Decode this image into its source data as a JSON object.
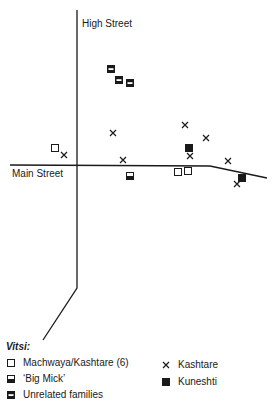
{
  "streets": {
    "high_street": {
      "label": "High Street",
      "path": [
        [
          77,
          10
        ],
        [
          77,
          288
        ],
        [
          43,
          340
        ]
      ],
      "label_pos": [
        82,
        18
      ]
    },
    "main_street": {
      "label": "Main Street",
      "path": [
        [
          10,
          165
        ],
        [
          210,
          166
        ],
        [
          267,
          178
        ]
      ],
      "label_pos": [
        12,
        168
      ]
    }
  },
  "colors": {
    "ink": "#1a1a1a",
    "paper": "#ffffff"
  },
  "markers": {
    "machwaya_kashtare": [
      [
        55,
        148
      ],
      [
        178,
        172
      ],
      [
        188,
        171
      ]
    ],
    "big_mick": [
      [
        130,
        176
      ]
    ],
    "unrelated_families": [
      [
        111,
        69
      ],
      [
        119,
        80
      ],
      [
        130,
        83
      ]
    ],
    "kashtare": [
      [
        64,
        155
      ],
      [
        113,
        133
      ],
      [
        123,
        160
      ],
      [
        185,
        125
      ],
      [
        206,
        138
      ],
      [
        190,
        156
      ],
      [
        228,
        161
      ],
      [
        237,
        184
      ]
    ],
    "kuneshti": [
      [
        189,
        148
      ],
      [
        242,
        178
      ]
    ]
  },
  "legend": {
    "title": "Vitsi:",
    "items": [
      {
        "key": "machwaya_kashtare",
        "symbol": "open-square",
        "label": "Machwaya/Kashtare (6)"
      },
      {
        "key": "big_mick",
        "symbol": "bottom-filled-square",
        "label": "‘Big Mick’"
      },
      {
        "key": "unrelated_families",
        "symbol": "banded-square",
        "label": "Unrelated families"
      },
      {
        "key": "kashtare",
        "symbol": "cross",
        "label": "Kashtare"
      },
      {
        "key": "kuneshti",
        "symbol": "filled-square",
        "label": "Kuneshti"
      }
    ]
  }
}
